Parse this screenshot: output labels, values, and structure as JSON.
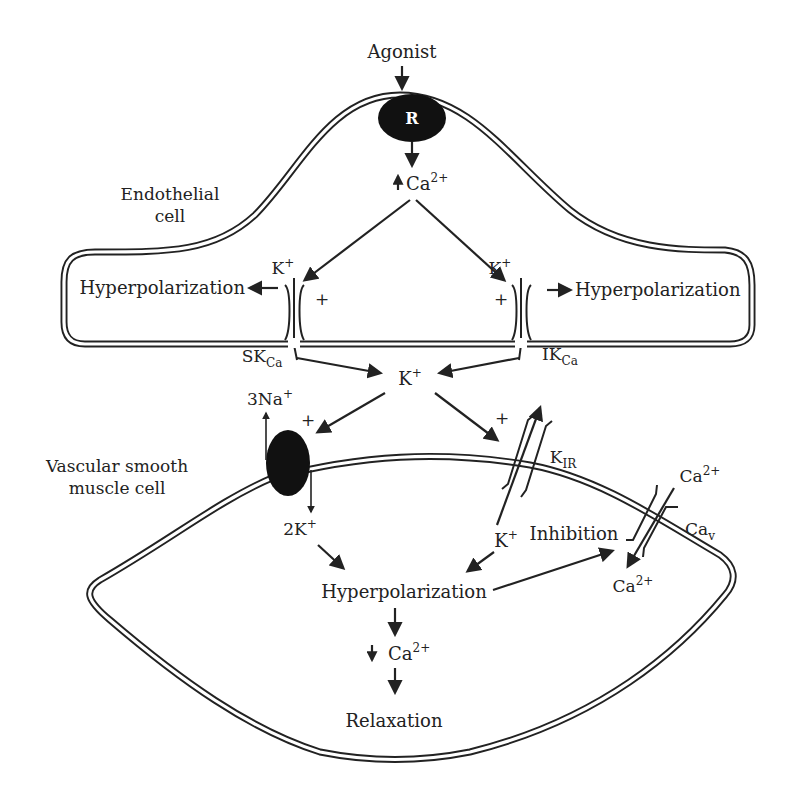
{
  "diagram": {
    "type": "biological-pathway",
    "colors": {
      "ink": "#222222",
      "background": "#ffffff",
      "receptor_fill": "#111111",
      "receptor_text": "#ffffff"
    }
  },
  "endothelial_cell": {
    "label_line1": "Endothelial",
    "label_line2": "cell",
    "agonist": "Agonist",
    "receptor": "R",
    "ca_increase": {
      "arrow": "↑",
      "ion": "Ca",
      "charge": "2+"
    },
    "left_channel": {
      "ion": "K",
      "charge": "+",
      "plus": "+",
      "name": "SK",
      "name_sub": "Ca",
      "effect": "Hyperpolarization"
    },
    "right_channel": {
      "ion": "K",
      "charge": "+",
      "plus": "+",
      "name": "IK",
      "name_sub": "Ca",
      "effect": "Hyperpolarization"
    }
  },
  "interstitial": {
    "k_ion": {
      "ion": "K",
      "charge": "+"
    }
  },
  "smooth_muscle_cell": {
    "label_line1": "Vascular smooth",
    "label_line2": "muscle cell",
    "pump": {
      "na_out": "3Na",
      "na_charge": "+",
      "k_in": "2K",
      "k_charge": "+",
      "plus": "+"
    },
    "kir_channel": {
      "name": "K",
      "name_sub": "IR",
      "plus": "+",
      "k_ion": "K",
      "k_charge": "+"
    },
    "cav_channel": {
      "name": "Ca",
      "name_sub": "v",
      "ca_out": "Ca",
      "ca_out_charge": "2+",
      "ca_in": "Ca",
      "ca_in_charge": "2+",
      "inhibition": "Inhibition"
    },
    "hyperpolarization": "Hyperpolarization",
    "ca_decrease": {
      "arrow": "↓",
      "ion": "Ca",
      "charge": "2+"
    },
    "relaxation": "Relaxation"
  }
}
